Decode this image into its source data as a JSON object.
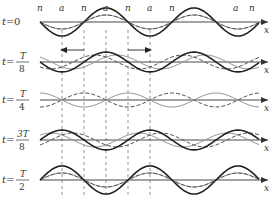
{
  "figure": {
    "axis_label": "x",
    "node_label": "n",
    "antinode_label": "a",
    "top_labels": [
      "n",
      "a",
      "n",
      "a",
      "n",
      "a",
      "n"
    ],
    "rows": [
      {
        "t_prefix": "t=",
        "t_value": "0",
        "fraction": false
      },
      {
        "t_prefix": "t=",
        "numerator": "T",
        "denominator": "8",
        "fraction": true
      },
      {
        "t_prefix": "t=",
        "numerator": "T",
        "denominator": "4",
        "fraction": true
      },
      {
        "t_prefix": "t=",
        "numerator": "3T",
        "denominator": "8",
        "fraction": true
      },
      {
        "t_prefix": "t=",
        "numerator": "T",
        "denominator": "2",
        "fraction": true
      }
    ],
    "arrows": {
      "left": "left-travelling wave",
      "right": "right-travelling wave"
    },
    "colors": {
      "resultant": "#222222",
      "component": "#999999",
      "dashed": "#555555",
      "axis": "#333333"
    }
  }
}
